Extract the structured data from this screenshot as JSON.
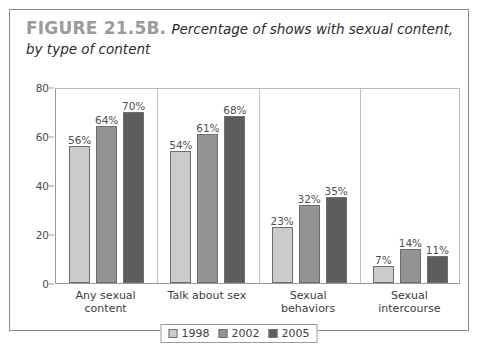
{
  "figure": {
    "label": "FIGURE 21.5B.",
    "caption": "Percentage of shows with sexual content, by type of content"
  },
  "chart_data": {
    "type": "bar",
    "title": "Percentage of shows with sexual content, by type of content",
    "xlabel": "",
    "ylabel": "",
    "ylim": [
      0,
      80
    ],
    "yticks": [
      0,
      20,
      40,
      60,
      80
    ],
    "ytick_labels": [
      "0",
      "20",
      "40",
      "60",
      "80"
    ],
    "grid": false,
    "legend_position": "bottom-center",
    "categories": [
      "Any sexual content",
      "Talk about sex",
      "Sexual behaviors",
      "Sexual intercourse"
    ],
    "category_lines": [
      [
        "Any sexual",
        "content"
      ],
      [
        "Talk about sex",
        ""
      ],
      [
        "Sexual",
        "behaviors"
      ],
      [
        "Sexual",
        "intercourse"
      ]
    ],
    "series": [
      {
        "name": "1998",
        "color": "#cbcbcb",
        "values": [
          56,
          54,
          23,
          7
        ],
        "labels": [
          "56%",
          "54%",
          "23%",
          "7%"
        ]
      },
      {
        "name": "2002",
        "color": "#949494",
        "values": [
          64,
          61,
          32,
          14
        ],
        "labels": [
          "64%",
          "61%",
          "32%",
          "14%"
        ]
      },
      {
        "name": "2005",
        "color": "#5d5d5d",
        "values": [
          70,
          68,
          35,
          11
        ],
        "labels": [
          "70%",
          "68%",
          "35%",
          "11%"
        ]
      }
    ]
  }
}
